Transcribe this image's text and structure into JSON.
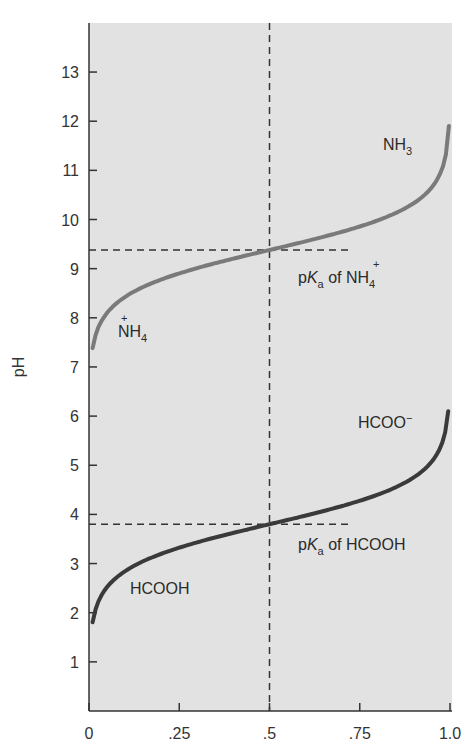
{
  "chart_data": {
    "type": "line",
    "title": "",
    "xlabel": "",
    "ylabel": "pH",
    "xlim": [
      0,
      1.0
    ],
    "ylim": [
      0,
      14
    ],
    "grid": false,
    "legend": "none (inline labels)",
    "x_ticks": [
      "0",
      ".25",
      ".5",
      ".75",
      "1.0"
    ],
    "y_ticks": [
      "1",
      "2",
      "3",
      "4",
      "5",
      "6",
      "7",
      "8",
      "9",
      "10",
      "11",
      "12",
      "13"
    ],
    "series": [
      {
        "name": "NH4+ / NH3",
        "pKa": 9.38,
        "color": "#7a7a7a",
        "x": [
          0.01,
          0.05,
          0.1,
          0.2,
          0.3,
          0.4,
          0.5,
          0.6,
          0.7,
          0.8,
          0.9,
          0.95,
          0.997
        ],
        "y": [
          7.38,
          8.1,
          8.43,
          8.78,
          9.01,
          9.2,
          9.38,
          9.56,
          9.75,
          9.98,
          10.33,
          10.66,
          11.9
        ]
      },
      {
        "name": "HCOOH / HCOO-",
        "pKa": 3.8,
        "color": "#3a3a3a",
        "x": [
          0.01,
          0.05,
          0.1,
          0.2,
          0.3,
          0.4,
          0.5,
          0.6,
          0.7,
          0.8,
          0.9,
          0.95,
          0.995
        ],
        "y": [
          1.8,
          2.52,
          2.85,
          3.2,
          3.43,
          3.62,
          3.8,
          3.98,
          4.17,
          4.4,
          4.75,
          5.08,
          6.3
        ]
      }
    ],
    "reference_lines": [
      {
        "type": "vertical",
        "x": 0.5,
        "style": "dashed"
      },
      {
        "type": "horizontal",
        "y": 9.38,
        "x_range": [
          0,
          0.73
        ],
        "style": "dashed",
        "label": "pKa of NH4+"
      },
      {
        "type": "horizontal",
        "y": 3.8,
        "x_range": [
          0,
          0.73
        ],
        "style": "dashed",
        "label": "pKa of HCOOH"
      }
    ],
    "annotations": [
      {
        "text": "NH3",
        "x": 0.83,
        "y": 11.4
      },
      {
        "text": "NH4+",
        "x": 0.08,
        "y": 7.6
      },
      {
        "text": "pKa of NH4+",
        "x": 0.55,
        "y": 8.9
      },
      {
        "text": "HCOO−",
        "x": 0.75,
        "y": 5.9
      },
      {
        "text": "HCOOH",
        "x": 0.11,
        "y": 2.3
      },
      {
        "text": "pKa of HCOOH",
        "x": 0.55,
        "y": 3.3
      }
    ]
  },
  "labels": {
    "y_axis_title": "pH",
    "nh3_main": "NH",
    "nh3_sub": "3",
    "nh4_main": "NH",
    "nh4_sub": "4",
    "nh4_charge": "+",
    "pka_p": "p",
    "pka_K": "K",
    "pka_sub": "a",
    "pka_nh4_of": " of ",
    "pka_hcooh_text": " of HCOOH",
    "hcoo_main": "HCOO",
    "hcoo_charge": "−",
    "hcooh": "HCOOH"
  },
  "colors": {
    "plot_bg": "#e2e2e2",
    "axis": "#333333",
    "dash": "#333333",
    "nh_curve": "#7a7a7a",
    "hcooh_curve": "#3a3a3a"
  }
}
